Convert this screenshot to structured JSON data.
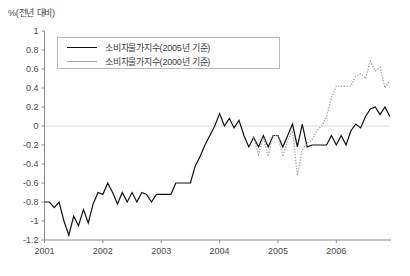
{
  "chart_data": {
    "type": "line",
    "title": "",
    "ylabel": "%(전년 대비)",
    "xlabel": "",
    "ylim": [
      -1.2,
      1.0
    ],
    "xlim": [
      2001.0,
      2006.92
    ],
    "grid": false,
    "zero_line": true,
    "legend_position": "top-left",
    "y_ticks": [
      1,
      0.8,
      0.6,
      0.4,
      0.2,
      0,
      -0.2,
      -0.4,
      -0.6,
      -0.8,
      -1,
      -1.2
    ],
    "y_tick_labels": [
      "1",
      "0.8",
      "0.6",
      "0.4",
      "0.2",
      "0",
      "-0.2",
      "-0.4",
      "-0.6",
      "-0.8",
      "-1",
      "-1.2"
    ],
    "x_ticks": [
      2001,
      2002,
      2003,
      2004,
      2005,
      2006
    ],
    "x_tick_labels": [
      "2001",
      "2002",
      "2003",
      "2004",
      "2005",
      "2006"
    ],
    "series": [
      {
        "name": "소비자물가지수(2005년 기준)",
        "color": "#111111",
        "style": "solid",
        "x": [
          2001.0,
          2001.083,
          2001.167,
          2001.25,
          2001.333,
          2001.417,
          2001.5,
          2001.583,
          2001.667,
          2001.75,
          2001.833,
          2001.917,
          2002.0,
          2002.083,
          2002.167,
          2002.25,
          2002.333,
          2002.417,
          2002.5,
          2002.583,
          2002.667,
          2002.75,
          2002.833,
          2002.917,
          2003.0,
          2003.083,
          2003.167,
          2003.25,
          2003.333,
          2003.417,
          2003.5,
          2003.583,
          2003.667,
          2003.75,
          2003.833,
          2003.917,
          2004.0,
          2004.083,
          2004.167,
          2004.25,
          2004.333,
          2004.417,
          2004.5,
          2004.583,
          2004.667,
          2004.75,
          2004.833,
          2004.917,
          2005.0,
          2005.083,
          2005.167,
          2005.25,
          2005.333,
          2005.417,
          2005.5,
          2005.583,
          2005.667,
          2005.75,
          2005.833,
          2005.917,
          2006.0,
          2006.083,
          2006.167,
          2006.25,
          2006.333,
          2006.417,
          2006.5,
          2006.583,
          2006.667,
          2006.75,
          2006.833,
          2006.917
        ],
        "values": [
          -0.8,
          -0.8,
          -0.86,
          -0.8,
          -1.0,
          -1.15,
          -0.95,
          -1.05,
          -0.88,
          -1.02,
          -0.82,
          -0.7,
          -0.72,
          -0.6,
          -0.7,
          -0.82,
          -0.7,
          -0.8,
          -0.7,
          -0.8,
          -0.7,
          -0.72,
          -0.8,
          -0.72,
          -0.72,
          -0.72,
          -0.72,
          -0.6,
          -0.6,
          -0.6,
          -0.6,
          -0.42,
          -0.32,
          -0.2,
          -0.1,
          0.0,
          0.13,
          0.0,
          0.08,
          -0.02,
          0.06,
          -0.1,
          -0.22,
          -0.12,
          -0.22,
          -0.1,
          -0.22,
          -0.1,
          -0.1,
          -0.22,
          -0.1,
          0.02,
          -0.22,
          0.02,
          -0.22,
          -0.2,
          -0.2,
          -0.2,
          -0.2,
          -0.1,
          -0.2,
          -0.1,
          -0.2,
          -0.05,
          0.02,
          -0.02,
          0.1,
          0.18,
          0.2,
          0.12,
          0.2,
          0.1
        ]
      },
      {
        "name": "소비자물가지수(2000년 기준)",
        "color": "#a8a8a8",
        "style": "dotted",
        "x": [
          2004.583,
          2004.667,
          2004.75,
          2004.833,
          2004.917,
          2005.0,
          2005.083,
          2005.167,
          2005.25,
          2005.333,
          2005.417,
          2005.5,
          2005.583,
          2005.667,
          2005.75,
          2005.833,
          2005.917,
          2006.0,
          2006.083,
          2006.167,
          2006.25,
          2006.333,
          2006.417,
          2006.5,
          2006.583,
          2006.667,
          2006.75,
          2006.833,
          2006.917
        ],
        "values": [
          -0.12,
          -0.3,
          -0.12,
          -0.32,
          -0.1,
          -0.1,
          -0.32,
          -0.15,
          -0.05,
          -0.52,
          -0.25,
          -0.18,
          -0.15,
          -0.05,
          0.0,
          0.1,
          0.3,
          0.42,
          0.42,
          0.42,
          0.42,
          0.52,
          0.55,
          0.5,
          0.68,
          0.58,
          0.62,
          0.4,
          0.48
        ]
      }
    ]
  },
  "legend": {
    "entries": [
      {
        "label": "소비자물가지수(2005년 기준)"
      },
      {
        "label": "소비자물가지수(2000년 기준)"
      }
    ]
  }
}
